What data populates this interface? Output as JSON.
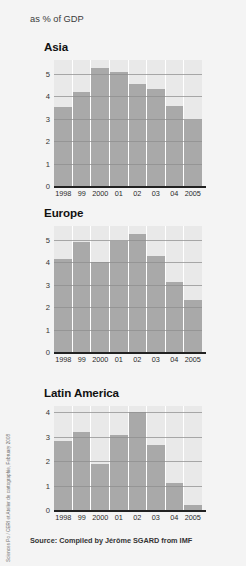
{
  "header": {
    "note": "as % of GDP"
  },
  "source": {
    "text": "Source: Compiled by Jérôme SGARD from IMF"
  },
  "credit": {
    "text": "Sciences Po / CERI et Atelier de cartographie, February 2008"
  },
  "colors": {
    "bar": "#a9a9a9",
    "plot_background": "#e9e9e9",
    "page_background": "#f4f4f4",
    "gridline": "#8f8f8f",
    "axis": "#222222"
  },
  "chart_data": [
    {
      "type": "bar",
      "title": "Asia",
      "xlabel": "",
      "ylabel": "as % of GDP",
      "categories": [
        "1998",
        "99",
        "2000",
        "01",
        "02",
        "03",
        "04",
        "2005"
      ],
      "values": [
        3.5,
        4.2,
        5.25,
        5.05,
        4.55,
        4.3,
        3.55,
        2.95
      ],
      "ylim": [
        0,
        5.6
      ],
      "yticks": [
        1,
        2,
        3,
        4,
        5
      ],
      "grid": true,
      "legend": "none"
    },
    {
      "type": "bar",
      "title": "Europe",
      "xlabel": "",
      "ylabel": "as % of GDP",
      "categories": [
        "1998",
        "99",
        "2000",
        "01",
        "02",
        "03",
        "04",
        "2005"
      ],
      "values": [
        4.15,
        4.9,
        4.0,
        4.95,
        5.25,
        4.25,
        3.1,
        2.3
      ],
      "ylim": [
        0,
        5.6
      ],
      "yticks": [
        1,
        2,
        3,
        4,
        5
      ],
      "grid": true,
      "legend": "none"
    },
    {
      "type": "bar",
      "title": "Latin America",
      "xlabel": "",
      "ylabel": "as % of GDP",
      "categories": [
        "1998",
        "99",
        "2000",
        "01",
        "02",
        "03",
        "04",
        "2005"
      ],
      "values": [
        2.8,
        3.2,
        1.9,
        3.05,
        4.0,
        2.65,
        1.1,
        0.2
      ],
      "ylim": [
        0,
        4.25
      ],
      "yticks": [
        1,
        2,
        3,
        4
      ],
      "grid": true,
      "legend": "none"
    }
  ]
}
